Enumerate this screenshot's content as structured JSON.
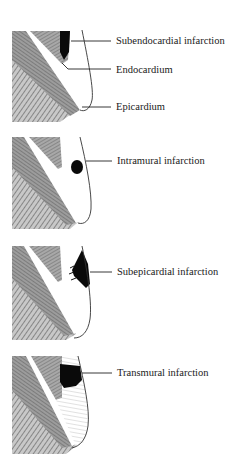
{
  "diagram": {
    "panels": [
      {
        "id": "subendocardial",
        "labels": [
          "Subendocardial infarction",
          "Endocardium",
          "Epicardium"
        ]
      },
      {
        "id": "intramural",
        "labels": [
          "Intramural infarction"
        ]
      },
      {
        "id": "subepicardial",
        "labels": [
          "Subepicardial infarction"
        ]
      },
      {
        "id": "transmural",
        "labels": [
          "Transmural infarction"
        ]
      }
    ],
    "colors": {
      "muscle_dark": "#6e6e6e",
      "muscle_mid": "#9a9a9a",
      "hatch_light": "#bdbdbd",
      "infarct": "#0a0a0a",
      "line": "#222222",
      "background": "#ffffff"
    }
  }
}
